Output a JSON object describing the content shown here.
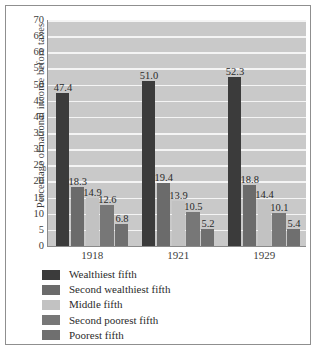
{
  "chart_data": {
    "type": "bar",
    "title": "",
    "xlabel": "",
    "ylabel": "Percentage of national income before taxes",
    "categories": [
      "1918",
      "1921",
      "1929"
    ],
    "ylim": [
      0,
      70
    ],
    "yticks": [
      0,
      5,
      10,
      15,
      20,
      25,
      30,
      35,
      40,
      45,
      50,
      55,
      60,
      65,
      70
    ],
    "ytick_labels": [
      "0",
      "5",
      "10",
      "15",
      "20",
      "25",
      "30",
      "35",
      "40",
      "45",
      "50",
      "55",
      "60",
      "65",
      "70"
    ],
    "grid": true,
    "grid_axis": "y",
    "legend_position": "below",
    "series": [
      {
        "name": "Wealthiest fifth",
        "color": "#3b3b3b",
        "values": [
          47.4,
          51.0,
          52.3
        ],
        "labels": [
          "47.4",
          "51.0",
          "52.3"
        ]
      },
      {
        "name": "Second wealthiest fifth",
        "color": "#6b6b6b",
        "values": [
          18.3,
          19.4,
          18.8
        ],
        "labels": [
          "18.3",
          "19.4",
          "18.8"
        ]
      },
      {
        "name": "Middle fifth",
        "color": "#c2c2c2",
        "values": [
          14.9,
          13.9,
          14.4
        ],
        "labels": [
          "14.9",
          "13.9",
          "14.4"
        ]
      },
      {
        "name": "Second poorest fifth",
        "color": "#777777",
        "values": [
          12.6,
          10.5,
          10.1
        ],
        "labels": [
          "12.6",
          "10.5",
          "10.1"
        ]
      },
      {
        "name": "Poorest fifth",
        "color": "#6f6f6f",
        "values": [
          6.8,
          5.2,
          5.4
        ],
        "labels": [
          "6.8",
          "5.2",
          "5.4"
        ]
      }
    ],
    "plot_background": "#c9c9c9",
    "gridline_color": "#f4f4f4",
    "axis_color": "#8a8a8a",
    "frame_color": "#8f8f8f"
  }
}
